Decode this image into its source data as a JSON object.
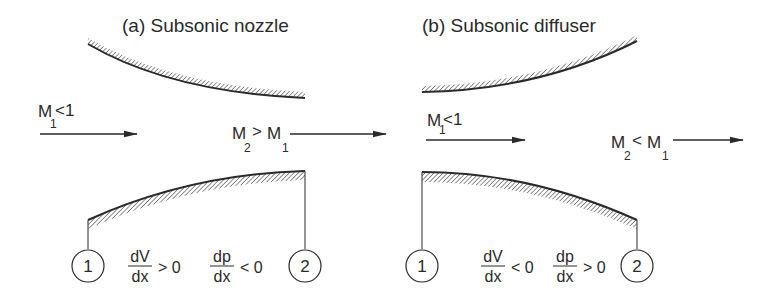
{
  "panels": [
    {
      "id": "a",
      "title": "(a) Subsonic nozzle",
      "inlet_label": {
        "main": "M",
        "sub": "1",
        "rest": "<1"
      },
      "outlet_label": {
        "m2": "M",
        "m2_sub": "2",
        "op": ">",
        "m1": "M",
        "m1_sub": "1"
      },
      "station_1": "1",
      "station_2": "2",
      "dv": {
        "num": "dV",
        "den": "dx",
        "rel": "> 0"
      },
      "dp": {
        "num": "dp",
        "den": "dx",
        "rel": "< 0"
      }
    },
    {
      "id": "b",
      "title": "(b) Subsonic diffuser",
      "inlet_label": {
        "main": "M",
        "sub": "1",
        "rest": "<1"
      },
      "outlet_label": {
        "m2": "M",
        "m2_sub": "2",
        "op": "<",
        "m1": "M",
        "m1_sub": "1"
      },
      "station_1": "1",
      "station_2": "2",
      "dv": {
        "num": "dV",
        "den": "dx",
        "rel": "< 0"
      },
      "dp": {
        "num": "dp",
        "den": "dx",
        "rel": "> 0"
      }
    }
  ],
  "colors": {
    "line": "#2a2a2a",
    "hatch": "#555555",
    "background": "#ffffff"
  }
}
